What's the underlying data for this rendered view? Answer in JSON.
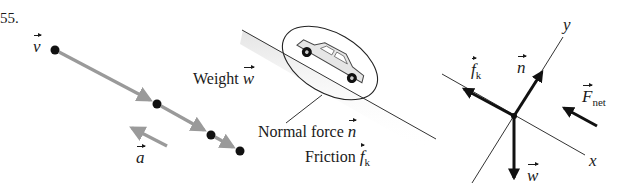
{
  "problem_number": "55.",
  "motion_diagram": {
    "velocity_label": "v",
    "acceleration_label": "a",
    "dots": [
      [
        55,
        50
      ],
      [
        157,
        104
      ],
      [
        211,
        135
      ],
      [
        240,
        151
      ]
    ],
    "arrow_color": "#9a9a9a",
    "dot_color": "#111111"
  },
  "pictorial": {
    "weight_label": "Weight",
    "weight_symbol": "w",
    "normal_label": "Normal force",
    "normal_symbol": "n",
    "friction_label": "Friction",
    "friction_symbol": "f",
    "friction_sub": "k"
  },
  "free_body_diagram": {
    "x_axis_label": "x",
    "y_axis_label": "y",
    "friction_symbol": "f",
    "friction_sub": "k",
    "normal_symbol": "n",
    "weight_symbol": "w",
    "net_force_symbol": "F",
    "net_force_sub": "net",
    "force_color": "#111111"
  }
}
